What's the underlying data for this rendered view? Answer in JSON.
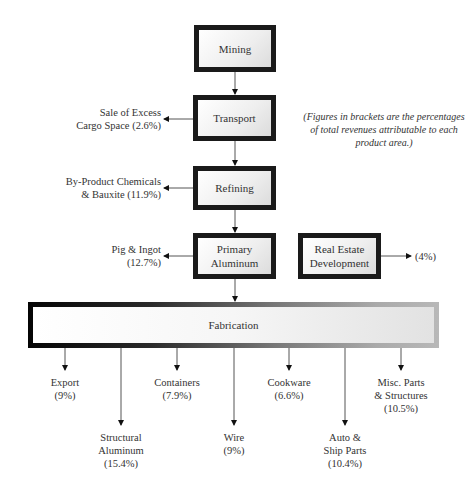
{
  "diagram": {
    "note": "(Figures in brackets are the percentages of total revenues attributable to each product area.)",
    "stages": [
      {
        "id": "mining",
        "label": "Mining"
      },
      {
        "id": "transport",
        "label": "Transport"
      },
      {
        "id": "refining",
        "label": "Refining"
      },
      {
        "id": "primary",
        "label_line1": "Primary",
        "label_line2": "Aluminum"
      },
      {
        "id": "realestate",
        "label_line1": "Real Estate",
        "label_line2": "Development"
      },
      {
        "id": "fabrication",
        "label": "Fabrication"
      }
    ],
    "side_outputs": {
      "transport": {
        "line1": "Sale of Excess",
        "line2": "Cargo Space (2.6%)"
      },
      "refining": {
        "line1": "By-Product Chemicals",
        "line2": "& Bauxite (11.9%)"
      },
      "primary": {
        "line1": "Pig & Ingot",
        "line2": "(12.7%)"
      },
      "realestate": {
        "line1": "(4%)"
      }
    },
    "fabrication_outputs": [
      {
        "line1": "Export",
        "line2": "(9%)"
      },
      {
        "line1": "Structural",
        "line2": "Aluminum",
        "line3": "(15.4%)"
      },
      {
        "line1": "Containers",
        "line2": "(7.9%)"
      },
      {
        "line1": "Wire",
        "line2": "(9%)"
      },
      {
        "line1": "Cookware",
        "line2": "(6.6%)"
      },
      {
        "line1": "Auto &",
        "line2": "Ship Parts",
        "line3": "(10.4%)"
      },
      {
        "line1": "Misc. Parts",
        "line2": "& Structures",
        "line3": "(10.5%)"
      }
    ]
  }
}
